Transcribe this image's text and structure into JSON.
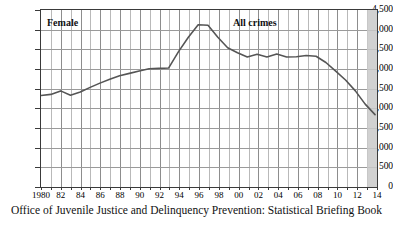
{
  "caption": "Office of Juvenile Justice and Delinquency Prevention: Statistical Briefing Book",
  "annotations": {
    "left_label": "Female",
    "right_label": "All crimes"
  },
  "colors": {
    "line": "#555555",
    "grid_minor": "#b9b9b9",
    "grid_major": "#8d8d8d",
    "axis": "#3a3a3a",
    "shaded_band": "#c9c9c9"
  },
  "chart_data": {
    "type": "line",
    "title": "",
    "subtitle": "",
    "xlabel": "",
    "ylabel": "",
    "grid": true,
    "legend": "none",
    "ylim": [
      0,
      4500
    ],
    "xlim": [
      1980,
      2014
    ],
    "ytick_labels": [
      "4,500",
      "4,000",
      "3,500",
      "3,000",
      "2,500",
      "2,000",
      "1,500",
      "1,000",
      "500",
      "0"
    ],
    "ytick_values": [
      4500,
      4000,
      3500,
      3000,
      2500,
      2000,
      1500,
      1000,
      500,
      0
    ],
    "xtick_labels": [
      "1980",
      "82",
      "84",
      "86",
      "88",
      "90",
      "92",
      "94",
      "96",
      "98",
      "00",
      "02",
      "04",
      "06",
      "08",
      "10",
      "12",
      "14"
    ],
    "xtick_values": [
      1980,
      1982,
      1984,
      1986,
      1988,
      1990,
      1992,
      1994,
      1996,
      1998,
      2000,
      2002,
      2004,
      2006,
      2008,
      2010,
      2012,
      2014
    ],
    "shaded_region": {
      "from": 2013,
      "to": 2014
    },
    "series": [
      {
        "name": "Female arrest rate, all crimes",
        "x": [
          1980,
          1981,
          1982,
          1983,
          1984,
          1985,
          1986,
          1987,
          1988,
          1989,
          1990,
          1991,
          1992,
          1993,
          1994,
          1995,
          1996,
          1997,
          1998,
          1999,
          2000,
          2001,
          2002,
          2003,
          2004,
          2005,
          2006,
          2007,
          2008,
          2009,
          2010,
          2011,
          2012,
          2013,
          2014
        ],
        "values": [
          2300,
          2330,
          2420,
          2310,
          2390,
          2510,
          2620,
          2720,
          2810,
          2870,
          2930,
          2990,
          3000,
          3010,
          3430,
          3800,
          4120,
          4110,
          3800,
          3530,
          3400,
          3290,
          3360,
          3290,
          3370,
          3290,
          3300,
          3330,
          3310,
          3150,
          2930,
          2700,
          2420,
          2080,
          1810
        ]
      }
    ]
  }
}
